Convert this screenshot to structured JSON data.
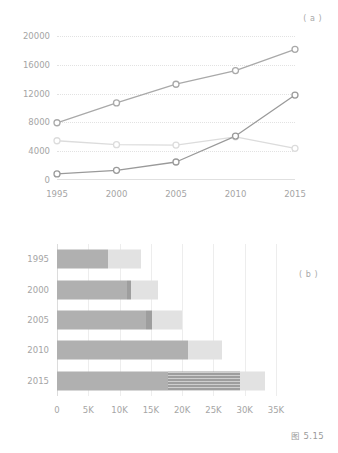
{
  "figure": {
    "caption": "图 5.15",
    "panel_a_tag": "( a )",
    "panel_b_tag": "( b )"
  },
  "chart_data": [
    {
      "type": "line",
      "panel": "(a)",
      "title": "",
      "xlabel": "",
      "ylabel": "",
      "x": [
        1995,
        2000,
        2005,
        2010,
        2015
      ],
      "xtick_labels": [
        "1995",
        "2000",
        "2005",
        "2010",
        "2015"
      ],
      "ytick_labels": [
        "0",
        "4000",
        "8000",
        "12000",
        "16000",
        "20000"
      ],
      "yticks": [
        0,
        4000,
        8000,
        12000,
        16000,
        20000
      ],
      "ylim": [
        0,
        20000
      ],
      "grid": "horizontal-dotted",
      "legend": "none",
      "marker": "open-circle",
      "series": [
        {
          "name": "series-upper",
          "color": "#a9a9a9",
          "values": [
            7950,
            10700,
            13300,
            15200,
            18150
          ]
        },
        {
          "name": "series-lower",
          "color": "#9a9a9a",
          "values": [
            850,
            1350,
            2500,
            6100,
            11800
          ]
        },
        {
          "name": "series-flat",
          "color": "#dcdcdc",
          "values": [
            5450,
            4900,
            4850,
            6000,
            4400
          ]
        }
      ]
    },
    {
      "type": "bar",
      "orientation": "horizontal",
      "stacked": true,
      "panel": "(b)",
      "title": "",
      "xlabel": "",
      "ylabel": "",
      "categories": [
        "1995",
        "2000",
        "2005",
        "2010",
        "2015"
      ],
      "xtick_labels": [
        "0",
        "5K",
        "10K",
        "15K",
        "20K",
        "25K",
        "30K",
        "35K"
      ],
      "xticks": [
        0,
        5000,
        10000,
        15000,
        20000,
        25000,
        30000,
        35000
      ],
      "xlim": [
        0,
        35000
      ],
      "grid": "vertical",
      "legend": "none",
      "series": [
        {
          "name": "segment-1",
          "color": "#b0b0b0",
          "values": [
            8200,
            11200,
            14300,
            20900,
            17800
          ]
        },
        {
          "name": "segment-2",
          "color": "#9e9e9e",
          "hatched_rows": [
            "2015"
          ],
          "values": [
            0,
            600,
            900,
            0,
            11500
          ]
        },
        {
          "name": "segment-3",
          "color": "#e2e2e2",
          "values": [
            5300,
            4300,
            4700,
            5500,
            3900
          ]
        }
      ]
    }
  ]
}
